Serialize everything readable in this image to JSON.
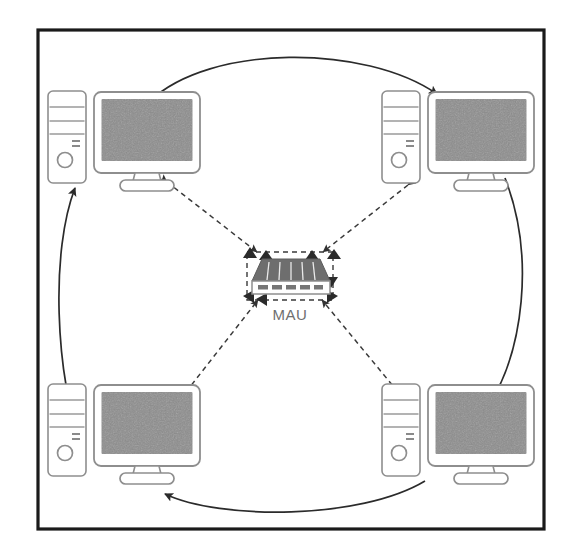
{
  "diagram": {
    "frame": {
      "border_color": "#1a1a1a",
      "background_color": "#ffffff",
      "x": 37,
      "y": 29,
      "width": 508,
      "height": 501
    },
    "center_device": {
      "label": "MAU",
      "label_color": "#6f6f6f",
      "device_top_color": "#6e6e6e",
      "device_body_color": "#ffffff",
      "outline_color": "#8a8a8a",
      "x": 247,
      "y": 253,
      "width": 84,
      "height": 42
    },
    "nodes": [
      {
        "id": "workstation-top-left",
        "label": "",
        "position": "top-left",
        "tower_x": 48,
        "tower_y": 91,
        "monitor_x": 92,
        "monitor_y": 92
      },
      {
        "id": "workstation-top-right",
        "label": "",
        "position": "top-right",
        "tower_x": 382,
        "tower_y": 91,
        "monitor_x": 426,
        "monitor_y": 92
      },
      {
        "id": "workstation-bottom-left",
        "label": "",
        "position": "bottom-left",
        "tower_x": 48,
        "tower_y": 384,
        "monitor_x": 92,
        "monitor_y": 385
      },
      {
        "id": "workstation-bottom-right",
        "label": "",
        "position": "bottom-right",
        "tower_x": 382,
        "tower_y": 384,
        "monitor_x": 426,
        "monitor_y": 385
      }
    ],
    "ring_links": [
      {
        "id": "ring-top",
        "from": "workstation-top-left",
        "to": "workstation-top-right",
        "style": "solid-arc-arrow"
      },
      {
        "id": "ring-right",
        "from": "workstation-top-right",
        "to": "workstation-bottom-right",
        "style": "solid-arc-arrow"
      },
      {
        "id": "ring-bottom",
        "from": "workstation-bottom-right",
        "to": "workstation-bottom-left",
        "style": "solid-arc-arrow"
      },
      {
        "id": "ring-left",
        "from": "workstation-bottom-left",
        "to": "workstation-top-left",
        "style": "solid-arc-arrow"
      }
    ],
    "mau_links": [
      {
        "id": "mau-link-top-left",
        "from": "mau",
        "to": "workstation-top-left",
        "style": "dashed-double-arrow"
      },
      {
        "id": "mau-link-top-right",
        "from": "mau",
        "to": "workstation-top-right",
        "style": "dashed-double-arrow"
      },
      {
        "id": "mau-link-bottom-left",
        "from": "mau",
        "to": "workstation-bottom-left",
        "style": "dashed-double-arrow"
      },
      {
        "id": "mau-link-bottom-right",
        "from": "mau",
        "to": "workstation-bottom-right",
        "style": "dashed-double-arrow"
      }
    ],
    "colors": {
      "screen_gray": "#8c8c8c",
      "outline_gray": "#8e8e8e",
      "line_dark": "#2b2b2b",
      "dashed_gray": "#4a4a4a"
    }
  }
}
